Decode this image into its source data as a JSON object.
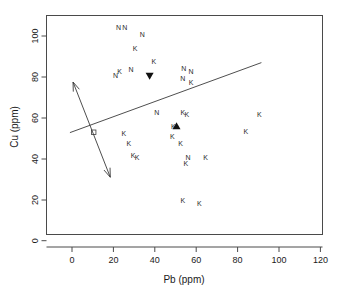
{
  "chart_data": {
    "type": "scatter",
    "title": "",
    "xlabel": "Pb (ppm)",
    "ylabel": "Cu (ppm)",
    "xlim": [
      -10,
      125
    ],
    "ylim": [
      -8,
      114
    ],
    "xticks": [
      0,
      20,
      40,
      60,
      80,
      100,
      120
    ],
    "yticks": [
      0,
      20,
      40,
      60,
      80,
      100
    ],
    "xtick_labels": [
      "0",
      "20",
      "40",
      "60",
      "80",
      "100",
      "120"
    ],
    "ytick_labels": [
      "0",
      "20",
      "40",
      "60",
      "80",
      "100"
    ],
    "grid": false,
    "legend": "none",
    "point_label_groups": [
      {
        "name": "N",
        "label": "N",
        "count": 11
      },
      {
        "name": "K",
        "label": "K",
        "count": 27
      }
    ],
    "points": [
      {
        "label": "N",
        "x": 22.5,
        "y": 104.0
      },
      {
        "label": "N",
        "x": 25.5,
        "y": 104.0
      },
      {
        "label": "N",
        "x": 34.0,
        "y": 100.5
      },
      {
        "label": "K",
        "x": 30.5,
        "y": 94.0
      },
      {
        "label": "K",
        "x": 39.5,
        "y": 87.5
      },
      {
        "label": "N",
        "x": 28.5,
        "y": 83.5
      },
      {
        "label": "N",
        "x": 21.0,
        "y": 80.5
      },
      {
        "label": "K",
        "x": 23.0,
        "y": 82.5
      },
      {
        "label": "N",
        "x": 54.0,
        "y": 84.0
      },
      {
        "label": "N",
        "x": 57.5,
        "y": 82.5
      },
      {
        "label": "N",
        "x": 53.5,
        "y": 79.0
      },
      {
        "label": "K",
        "x": 57.5,
        "y": 77.5
      },
      {
        "label": "N",
        "x": 41.0,
        "y": 62.5
      },
      {
        "label": "K",
        "x": 53.5,
        "y": 62.5
      },
      {
        "label": "K",
        "x": 55.5,
        "y": 61.5
      },
      {
        "label": "K",
        "x": 90.5,
        "y": 61.5
      },
      {
        "label": "K",
        "x": 49.0,
        "y": 56.0
      },
      {
        "label": "K",
        "x": 84.0,
        "y": 53.5
      },
      {
        "label": "K",
        "x": 48.5,
        "y": 51.0
      },
      {
        "label": "K",
        "x": 52.5,
        "y": 47.5
      },
      {
        "label": "K",
        "x": 25.0,
        "y": 52.5
      },
      {
        "label": "K",
        "x": 27.5,
        "y": 47.5
      },
      {
        "label": "K",
        "x": 29.5,
        "y": 41.5
      },
      {
        "label": "K",
        "x": 31.5,
        "y": 40.5
      },
      {
        "label": "N",
        "x": 56.0,
        "y": 40.5
      },
      {
        "label": "K",
        "x": 64.5,
        "y": 40.5
      },
      {
        "label": "K",
        "x": 55.0,
        "y": 37.5
      },
      {
        "label": "K",
        "x": 53.5,
        "y": 19.5
      },
      {
        "label": "K",
        "x": 61.5,
        "y": 18.0
      }
    ],
    "special_markers": [
      {
        "name": "group-centroid-down-triangle",
        "shape": "triangle-down",
        "x": 37.5,
        "y": 80.5
      },
      {
        "name": "group-centroid-up-triangle",
        "shape": "triangle-up",
        "x": 50.5,
        "y": 56.0
      },
      {
        "name": "origin-centroid",
        "shape": "open-square",
        "x": 10.5,
        "y": 53.0
      }
    ],
    "fit_line": {
      "name": "regression-line",
      "x1": -1.0,
      "y1": 52.8,
      "x2": 91.5,
      "y2": 87.0
    },
    "vector_arrow": {
      "name": "double-headed-vector",
      "x1": 0.5,
      "y1": 77.5,
      "x2": 18.5,
      "y2": 31.0,
      "double_headed": true
    }
  }
}
